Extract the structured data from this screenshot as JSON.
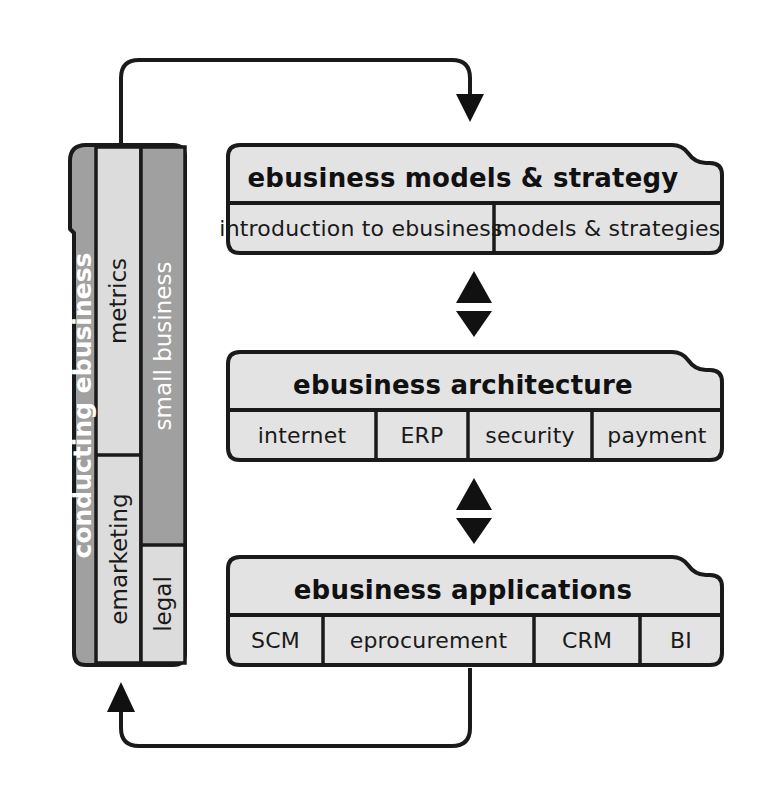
{
  "diagram": {
    "colors": {
      "dark_gray": "#a0a0a0",
      "light_gray": "#dcdcdc",
      "box_fill": "#e3e3e3",
      "stroke": "#1a1a1a",
      "white_text": "#ffffff",
      "dark_text": "#1a1a1a"
    }
  },
  "sidebar": {
    "name": "conducting ebusiness",
    "columns": [
      {
        "id": "col-spine",
        "cells": [
          {
            "label": "conducting ebusiness",
            "tone": "dark",
            "text_color": "#ffffff",
            "bold": true
          }
        ]
      },
      {
        "id": "col-metrics-emarketing",
        "cells": [
          {
            "label": "metrics",
            "tone": "light",
            "text_color": "#1a1a1a",
            "bold": false
          },
          {
            "label": "emarketing",
            "tone": "light",
            "text_color": "#1a1a1a",
            "bold": false
          }
        ]
      },
      {
        "id": "col-smallbusiness-legal",
        "cells": [
          {
            "label": "small business",
            "tone": "dark",
            "text_color": "#ffffff",
            "bold": false
          },
          {
            "label": "legal",
            "tone": "light",
            "text_color": "#1a1a1a",
            "bold": false
          }
        ]
      }
    ]
  },
  "layers": [
    {
      "id": "layer-models-strategy",
      "title": "ebusiness models & strategy",
      "cells": [
        {
          "label": "introduction to ebusiness"
        },
        {
          "label": "models & strategies"
        }
      ]
    },
    {
      "id": "layer-architecture",
      "title": "ebusiness architecture",
      "cells": [
        {
          "label": "internet"
        },
        {
          "label": "ERP"
        },
        {
          "label": "security"
        },
        {
          "label": "payment"
        }
      ]
    },
    {
      "id": "layer-applications",
      "title": "ebusiness applications",
      "cells": [
        {
          "label": "SCM"
        },
        {
          "label": "eprocurement"
        },
        {
          "label": "CRM"
        },
        {
          "label": "BI"
        }
      ]
    }
  ],
  "connectors": [
    {
      "id": "feedback-top",
      "icon": "curved-arrow-right-down",
      "from": "sidebar",
      "to": "layer-models-strategy"
    },
    {
      "id": "link-1-2-up",
      "icon": "triangle-up-icon"
    },
    {
      "id": "link-1-2-down",
      "icon": "triangle-down-icon"
    },
    {
      "id": "link-2-3-up",
      "icon": "triangle-up-icon"
    },
    {
      "id": "link-2-3-down",
      "icon": "triangle-down-icon"
    },
    {
      "id": "feedback-bottom",
      "icon": "curved-arrow-left-up",
      "from": "layer-applications",
      "to": "sidebar"
    }
  ]
}
